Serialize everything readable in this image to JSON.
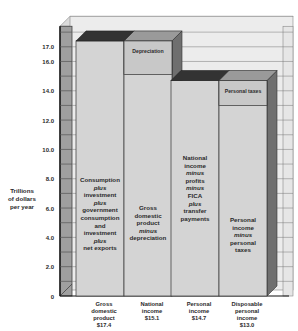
{
  "chart_data": {
    "type": "bar",
    "title": "",
    "xlabel": "",
    "ylabel": "Trillions of dollars per year",
    "ylabel_lines": [
      "Trillions",
      "of dollars",
      "per year"
    ],
    "ylim": [
      0,
      18
    ],
    "yticks": [
      "0",
      "2.0",
      "4.0",
      "6.0",
      "8.0",
      "10.0",
      "12.0",
      "14.0",
      "16.0",
      "17.0"
    ],
    "grid": true,
    "style": "3d-stacked-bar",
    "categories": [
      "Gross domestic product",
      "National income",
      "Personal income",
      "Disposable personal income"
    ],
    "category_labels": [
      [
        "Gross",
        "domestic",
        "product",
        "$17.4"
      ],
      [
        "National",
        "income",
        "$15.1"
      ],
      [
        "Personal",
        "income",
        "$14.7"
      ],
      [
        "Disposable",
        "personal",
        "income",
        "$13.0"
      ]
    ],
    "values": [
      17.4,
      15.1,
      14.7,
      13.0
    ],
    "series": [
      {
        "name": "Base amount",
        "values": [
          17.4,
          15.1,
          14.7,
          13.0
        ]
      },
      {
        "name": "Deduction",
        "values": [
          0,
          2.3,
          0,
          1.7
        ]
      }
    ],
    "segment_labels": {
      "top": [
        "",
        "Depreciation",
        "",
        "Personal taxes"
      ]
    },
    "bar_descriptions": [
      [
        "Consumption",
        "plus",
        "investment",
        "plus",
        "government",
        "consumption",
        "and",
        "investment",
        "plus",
        "net exports"
      ],
      [
        "Gross",
        "domestic",
        "product",
        "minus",
        "depreciation"
      ],
      [
        "National",
        "income",
        "minus",
        "profits",
        "minus",
        "FICA",
        "plus",
        "transfer",
        "payments"
      ],
      [
        "Personal",
        "income",
        "minus",
        "personal",
        "taxes"
      ]
    ],
    "italic_words": [
      "plus",
      "minus"
    ],
    "colors": {
      "bar_face": "#d4d4d4",
      "bar_top_dark": "#333333",
      "bar_top_light": "#9a9a9a",
      "bar_side": "#6f6f6f",
      "segment_face": "#c8c8c8",
      "back_wall": "#ececec",
      "left_wall": "#9f9f9f",
      "grid": "#555555"
    }
  }
}
